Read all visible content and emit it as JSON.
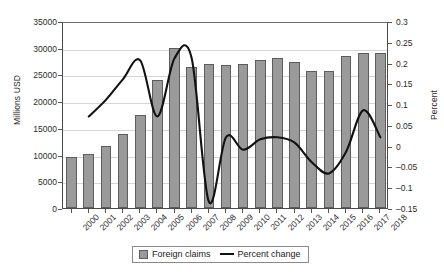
{
  "chart_data": {
    "type": "bar",
    "title": "",
    "xlabel": "",
    "ylabel": "Millions USD",
    "y2label": "Percent",
    "categories": [
      "2000",
      "2001",
      "2002",
      "2003",
      "2004",
      "2005",
      "2006",
      "2007",
      "2008",
      "2009",
      "2010",
      "2011",
      "2012",
      "2013",
      "2014",
      "2015",
      "2016",
      "2017",
      "2018"
    ],
    "ylim": [
      0,
      35000
    ],
    "y2lim": [
      -0.15,
      0.3
    ],
    "yticks": [
      "0",
      "5000",
      "10000",
      "15000",
      "20000",
      "25000",
      "30000",
      "35000"
    ],
    "y2ticks": [
      "-0.15",
      "-0.1",
      "-0.05",
      "0",
      "0.05",
      "0.1",
      "0.15",
      "0.2",
      "0.25",
      "0.3"
    ],
    "grid": true,
    "legend_position": "bottom",
    "series": [
      {
        "name": "Foreign claims",
        "type": "bar",
        "axis": "left",
        "color": "#9a9a9a",
        "values": [
          9500,
          10100,
          11600,
          13900,
          17500,
          24000,
          30000,
          26400,
          26900,
          26700,
          26900,
          27700,
          28000,
          27300,
          25600,
          25700,
          28400,
          29100,
          29100
        ]
      },
      {
        "name": "Percent change",
        "type": "line",
        "axis": "right",
        "color": "#111111",
        "values": [
          null,
          0.075,
          0.115,
          0.165,
          0.21,
          0.075,
          0.215,
          0.215,
          -0.13,
          0.025,
          -0.005,
          0.02,
          0.025,
          0.012,
          -0.035,
          -0.062,
          -0.01,
          0.09,
          0.025
        ]
      }
    ]
  },
  "legend": {
    "bar_label": "Foreign claims",
    "line_label": "Percent change"
  }
}
